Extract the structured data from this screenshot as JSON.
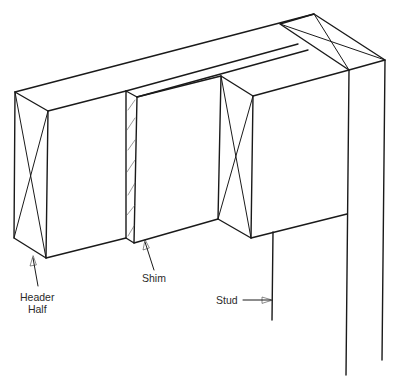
{
  "diagram": {
    "type": "isometric framing detail",
    "line_color": "#1a1a1a",
    "background": "#ffffff"
  },
  "labels": {
    "header_half_line1": "Header",
    "header_half_line2": "Half",
    "shim": "Shim",
    "stud": "Stud"
  },
  "components": [
    {
      "name": "Header Half",
      "description": "Solid lumber block with X end-grain marking (left and right)"
    },
    {
      "name": "Shim",
      "description": "Thin hatched plywood spacer between header halves"
    },
    {
      "name": "Stud",
      "description": "Vertical stud supporting header (jack stud) and full-height king stud with top plate"
    }
  ]
}
